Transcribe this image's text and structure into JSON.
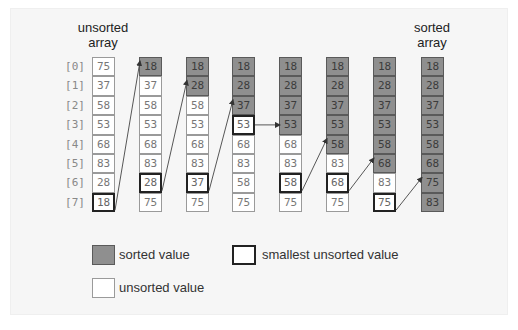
{
  "headers": {
    "unsorted": [
      "unsorted",
      "array"
    ],
    "sorted": [
      "sorted",
      "array"
    ]
  },
  "indices": [
    "[0]",
    "[1]",
    "[2]",
    "[3]",
    "[4]",
    "[5]",
    "[6]",
    "[7]"
  ],
  "columns": [
    {
      "values": [
        "75",
        "37",
        "58",
        "53",
        "68",
        "83",
        "28",
        "18"
      ],
      "states": [
        "u",
        "u",
        "u",
        "u",
        "u",
        "u",
        "u",
        "m"
      ]
    },
    {
      "values": [
        "18",
        "37",
        "58",
        "53",
        "68",
        "83",
        "28",
        "75"
      ],
      "states": [
        "s",
        "u",
        "u",
        "u",
        "u",
        "u",
        "m",
        "u"
      ]
    },
    {
      "values": [
        "18",
        "28",
        "58",
        "53",
        "68",
        "83",
        "37",
        "75"
      ],
      "states": [
        "s",
        "s",
        "u",
        "u",
        "u",
        "u",
        "m",
        "u"
      ]
    },
    {
      "values": [
        "18",
        "28",
        "37",
        "53",
        "68",
        "83",
        "58",
        "75"
      ],
      "states": [
        "s",
        "s",
        "s",
        "m",
        "u",
        "u",
        "u",
        "u"
      ]
    },
    {
      "values": [
        "18",
        "28",
        "37",
        "53",
        "68",
        "83",
        "58",
        "75"
      ],
      "states": [
        "s",
        "s",
        "s",
        "s",
        "u",
        "u",
        "m",
        "u"
      ]
    },
    {
      "values": [
        "18",
        "28",
        "37",
        "53",
        "58",
        "83",
        "68",
        "75"
      ],
      "states": [
        "s",
        "s",
        "s",
        "s",
        "s",
        "u",
        "m",
        "u"
      ]
    },
    {
      "values": [
        "18",
        "28",
        "37",
        "53",
        "58",
        "68",
        "83",
        "75"
      ],
      "states": [
        "s",
        "s",
        "s",
        "s",
        "s",
        "s",
        "u",
        "m"
      ]
    },
    {
      "values": [
        "18",
        "28",
        "37",
        "53",
        "58",
        "68",
        "75",
        "83"
      ],
      "states": [
        "s",
        "s",
        "s",
        "s",
        "s",
        "s",
        "s",
        "s"
      ]
    }
  ],
  "arrows": [
    {
      "from_col": 0,
      "from_row": 7,
      "to_col": 1,
      "to_row": 0
    },
    {
      "from_col": 1,
      "from_row": 6,
      "to_col": 2,
      "to_row": 1
    },
    {
      "from_col": 2,
      "from_row": 6,
      "to_col": 3,
      "to_row": 2
    },
    {
      "from_col": 3,
      "from_row": 3,
      "to_col": 4,
      "to_row": 3
    },
    {
      "from_col": 4,
      "from_row": 6,
      "to_col": 5,
      "to_row": 4
    },
    {
      "from_col": 5,
      "from_row": 6,
      "to_col": 6,
      "to_row": 5
    },
    {
      "from_col": 6,
      "from_row": 7,
      "to_col": 7,
      "to_row": 6
    }
  ],
  "legend": {
    "sorted": "sorted value",
    "unsorted": "unsorted value",
    "smallest": "smallest unsorted value"
  },
  "colors": {
    "sorted_fill": "#8f8f8f",
    "unsorted_fill": "#ffffff",
    "smallest_border": "#222222"
  }
}
